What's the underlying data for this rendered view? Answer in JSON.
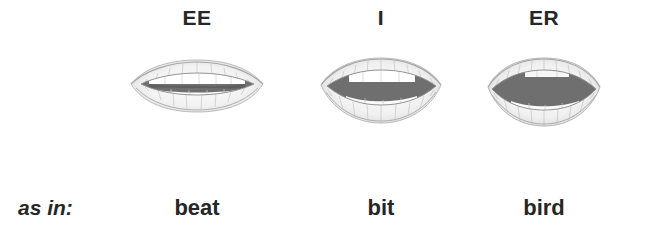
{
  "figure": {
    "row_label": "as in:",
    "text_color": "#262626",
    "background_color": "#ffffff",
    "lip_outline_color": "#9a9a9a",
    "mouth_interior_color": "#6f6f6f",
    "teeth_color": "#ffffff",
    "columns": [
      {
        "vowel": "EE",
        "word": "beat",
        "mouth_opening": "narrow",
        "icon": "lips-icon-ee"
      },
      {
        "vowel": "I",
        "word": "bit",
        "mouth_opening": "medium",
        "icon": "lips-icon-i"
      },
      {
        "vowel": "ER",
        "word": "bird",
        "mouth_opening": "wide",
        "icon": "lips-icon-er"
      }
    ]
  }
}
